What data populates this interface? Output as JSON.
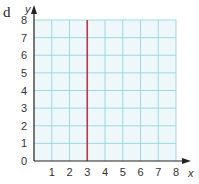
{
  "part_label": "d",
  "chart_data": {
    "type": "line",
    "title": "",
    "xlabel": "x",
    "ylabel": "y",
    "xlim": [
      0,
      8
    ],
    "ylim": [
      0,
      8
    ],
    "x_ticks": [
      "1",
      "2",
      "3",
      "4",
      "5",
      "6",
      "7",
      "8"
    ],
    "y_ticks": [
      "0",
      "1",
      "2",
      "3",
      "4",
      "5",
      "6",
      "7",
      "8"
    ],
    "grid": true,
    "series": [
      {
        "name": "x = 3",
        "x": [
          3,
          3
        ],
        "y": [
          0,
          8
        ],
        "color": "#c0334a"
      }
    ]
  },
  "colors": {
    "grid": "#9fd8df",
    "background": "#eef8fa",
    "axis": "#222222",
    "line": "#c0334a"
  }
}
